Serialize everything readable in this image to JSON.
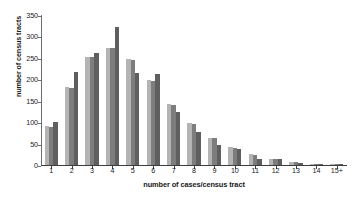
{
  "chart_data": {
    "type": "bar",
    "title": "",
    "subtitle": "",
    "xlabel": "number of cases/census tract",
    "ylabel": "number of census tracts",
    "categories": [
      "1",
      "2",
      "3",
      "4",
      "5",
      "6",
      "7",
      "8",
      "9",
      "10",
      "11",
      "12",
      "13",
      "14",
      "15+"
    ],
    "series": [
      {
        "name": "series-1",
        "color": "#b4b4b4",
        "values": [
          92,
          182,
          253,
          274,
          248,
          198,
          143,
          97,
          63,
          41,
          25,
          14,
          8,
          3,
          2
        ]
      },
      {
        "name": "series-2",
        "color": "#7d7d7d",
        "values": [
          89,
          180,
          251,
          272,
          246,
          196,
          141,
          95,
          62,
          40,
          23,
          14,
          7,
          3,
          2
        ]
      },
      {
        "name": "series-3",
        "color": "#5f5f5f",
        "values": [
          100,
          216,
          262,
          321,
          214,
          212,
          123,
          77,
          46,
          38,
          15,
          13,
          5,
          2,
          3
        ]
      }
    ],
    "ylim": [
      0,
      350
    ],
    "yticks": [
      0,
      50,
      100,
      150,
      200,
      250,
      300,
      350
    ],
    "ytick_labels": [
      "0",
      "50",
      "100",
      "150",
      "200",
      "250",
      "300",
      "350"
    ],
    "grid": false,
    "legend": "none",
    "axis_color": "#3d3d3d"
  }
}
